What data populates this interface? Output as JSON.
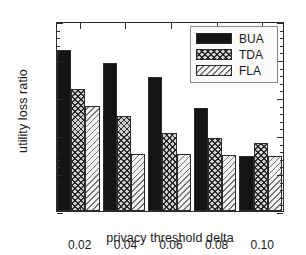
{
  "chart_data": {
    "type": "bar",
    "title": "",
    "xlabel": "privacy threshold delta",
    "ylabel": "utility loss ratio",
    "categories": [
      "0.02",
      "0.04",
      "0.06",
      "0.08",
      "0.10"
    ],
    "series": [
      {
        "name": "BUA",
        "values": [
          0.812,
          0.795,
          0.776,
          0.736,
          0.673
        ],
        "color": "#141414",
        "fill": "solid-black"
      },
      {
        "name": "TDA",
        "values": [
          0.761,
          0.725,
          0.702,
          0.696,
          0.69
        ],
        "color": "#cfcfcf",
        "fill": "cross-hatch"
      },
      {
        "name": "FLA",
        "values": [
          0.738,
          0.675,
          0.675,
          0.674,
          0.673
        ],
        "color": "#f2f2f2",
        "fill": "diagonal-hatch"
      }
    ],
    "ylim": [
      0.6,
      0.85
    ],
    "ytick_labels": [
      "0.60",
      "0.65",
      "0.70",
      "0.75",
      "0.80",
      "0.85"
    ],
    "ytick_values": [
      0.6,
      0.65,
      0.7,
      0.75,
      0.8,
      0.85
    ],
    "yminor_step": 0.01,
    "xtick_labels": [
      "0.02",
      "0.04",
      "0.06",
      "0.08",
      "0.10"
    ],
    "grid": false,
    "legend_position": "top-right",
    "axis_color": "#2b2b2b",
    "background": "#ffffff"
  }
}
